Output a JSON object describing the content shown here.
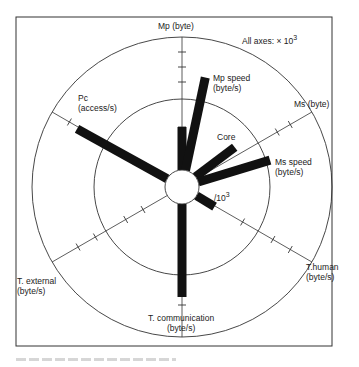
{
  "figure": {
    "scale_note_prefix": "All axes:  × 10",
    "scale_note_exp": "3",
    "center": [
      182,
      187
    ],
    "radii": {
      "hub": 17,
      "middle": 88,
      "outer": 150
    },
    "frame": {
      "x": 16,
      "y": 17,
      "w": 316,
      "h": 329
    }
  },
  "axes": [
    {
      "id": "mp",
      "angle": 0,
      "label": [
        "Mp (byte)"
      ],
      "ticks": [
        60,
        105,
        120,
        135
      ]
    },
    {
      "id": "ms",
      "angle": 60,
      "label": [
        "Ms (byte)"
      ],
      "ticks": [
        110,
        125
      ]
    },
    {
      "id": "thuman",
      "angle": 120,
      "label": [
        "T.human",
        "(byte/s)"
      ],
      "ticks": [
        70,
        105,
        125
      ]
    },
    {
      "id": "tcomm",
      "angle": 180,
      "label": [
        "T. communication",
        "(byte/s)"
      ],
      "ticks": [
        118
      ]
    },
    {
      "id": "text",
      "angle": 240,
      "label": [
        "T. external",
        "(byte/s)"
      ],
      "ticks": [
        45,
        65,
        100,
        120
      ]
    },
    {
      "id": "pc",
      "angle": 300,
      "label": [
        "Pc",
        "(access/s)"
      ],
      "ticks": [
        130
      ]
    }
  ],
  "bars": [
    {
      "id": "mp",
      "angle": 0,
      "length": 60
    },
    {
      "id": "mp-speed",
      "angle": 12,
      "length": 112,
      "label": [
        "Mp speed",
        "(byte/s)"
      ]
    },
    {
      "id": "core",
      "angle": 53,
      "length": 66,
      "label": [
        "Core"
      ]
    },
    {
      "id": "ms-speed",
      "angle": 73,
      "length": 92,
      "label": [
        "Ms speed",
        "(byte/s)"
      ]
    },
    {
      "id": "thuman",
      "angle": 121,
      "length": 38,
      "label_prefix": "/10",
      "label_exp": "3"
    },
    {
      "id": "tcomm",
      "angle": 180,
      "length": 110
    },
    {
      "id": "pc",
      "angle": 299,
      "length": 120
    }
  ],
  "colors": {
    "ink": "#111111",
    "line": "#333333",
    "bg": "#ffffff"
  }
}
